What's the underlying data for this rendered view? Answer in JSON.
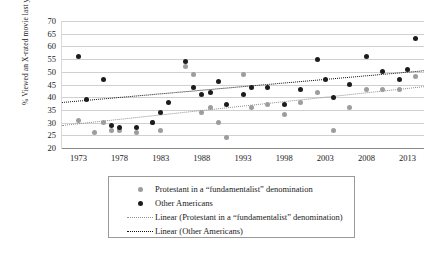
{
  "chart_data": {
    "type": "scatter",
    "title": "",
    "xlabel": "",
    "ylabel": "% Viewed an X-rated movie last year",
    "xlim": [
      1971,
      2015
    ],
    "ylim": [
      20,
      70
    ],
    "yticks": [
      20,
      25,
      30,
      35,
      40,
      45,
      50,
      55,
      60,
      65,
      70
    ],
    "xticks": [
      1973,
      1978,
      1983,
      1988,
      1993,
      1998,
      2003,
      2008,
      2013
    ],
    "grid": true,
    "legend_position": "below",
    "colors": {
      "series_0": "#9d9d9d",
      "series_1": "#1c1c1c",
      "grid": "#d0d0d0",
      "background": "#ffffff"
    },
    "series": [
      {
        "name": "Protestant in a “fundamentalist” denomination",
        "marker": "circle",
        "color": "#9d9d9d",
        "points": [
          [
            1973,
            31
          ],
          [
            1975,
            26
          ],
          [
            1976,
            30
          ],
          [
            1977,
            27
          ],
          [
            1978,
            27
          ],
          [
            1980,
            26
          ],
          [
            1982,
            30
          ],
          [
            1983,
            27
          ],
          [
            1986,
            52
          ],
          [
            1987,
            49
          ],
          [
            1988,
            34
          ],
          [
            1989,
            36
          ],
          [
            1990,
            30
          ],
          [
            1991,
            24
          ],
          [
            1993,
            49
          ],
          [
            1994,
            36
          ],
          [
            1996,
            37
          ],
          [
            1998,
            33
          ],
          [
            2000,
            38
          ],
          [
            2002,
            42
          ],
          [
            2004,
            27
          ],
          [
            2006,
            36
          ],
          [
            2008,
            43
          ],
          [
            2010,
            43
          ],
          [
            2012,
            43
          ],
          [
            2014,
            48
          ]
        ]
      },
      {
        "name": "Other Americans",
        "marker": "circle",
        "color": "#1c1c1c",
        "points": [
          [
            1973,
            56
          ],
          [
            1974,
            39
          ],
          [
            1976,
            47
          ],
          [
            1977,
            29
          ],
          [
            1978,
            28
          ],
          [
            1980,
            28
          ],
          [
            1982,
            30
          ],
          [
            1983,
            34
          ],
          [
            1984,
            38
          ],
          [
            1986,
            54
          ],
          [
            1987,
            44
          ],
          [
            1988,
            41
          ],
          [
            1989,
            42
          ],
          [
            1990,
            46
          ],
          [
            1991,
            37
          ],
          [
            1993,
            41
          ],
          [
            1994,
            44
          ],
          [
            1996,
            44
          ],
          [
            1998,
            37
          ],
          [
            2000,
            43
          ],
          [
            2002,
            55
          ],
          [
            2003,
            47
          ],
          [
            2004,
            40
          ],
          [
            2006,
            45
          ],
          [
            2008,
            56
          ],
          [
            2010,
            50
          ],
          [
            2012,
            47
          ],
          [
            2013,
            51
          ],
          [
            2014,
            63
          ]
        ]
      }
    ],
    "trendlines": [
      {
        "name": "Linear (Protestant in a “fundamentalist” denomination)",
        "color": "#8f8f8f",
        "style": "dotted",
        "x0": 1971,
        "y0": 29.2,
        "x1": 2015,
        "y1": 44.5
      },
      {
        "name": "Linear (Other Americans)",
        "color": "#111111",
        "style": "dotted",
        "x0": 1971,
        "y0": 38.0,
        "x1": 2015,
        "y1": 50.5
      }
    ],
    "legend": [
      {
        "label": "Protestant in a “fundamentalist” denomination",
        "key": "dot",
        "color": "#9d9d9d"
      },
      {
        "label": "Other Americans",
        "key": "dot",
        "color": "#1c1c1c"
      },
      {
        "label": "Linear (Protestant in a “fundamentalist” denomination)",
        "key": "line",
        "color": "#8f8f8f"
      },
      {
        "label": "Linear (Other Americans)",
        "key": "line",
        "color": "#111111"
      }
    ]
  }
}
